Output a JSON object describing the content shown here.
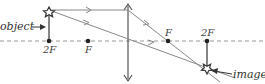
{
  "diagram": {
    "labels": {
      "object": "object",
      "image": "image"
    },
    "points": [
      {
        "id": "2F-left",
        "label": "2F",
        "x": 49
      },
      {
        "id": "F-left",
        "label": "F",
        "x": 88
      },
      {
        "id": "F-right",
        "label": "F",
        "x": 168
      },
      {
        "id": "2F-right",
        "label": "2F",
        "x": 207
      }
    ],
    "colors": {
      "ray": "#888888",
      "axis": "#888888",
      "lens": "#555555",
      "point": "#222222",
      "text": "#333333"
    }
  }
}
